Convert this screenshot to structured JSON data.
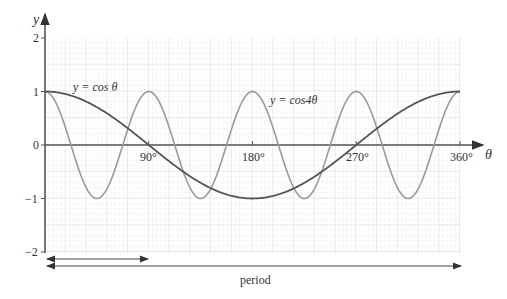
{
  "chart_data": {
    "type": "line",
    "title": "",
    "xlabel": "θ",
    "ylabel": "y",
    "xlim": [
      0,
      360
    ],
    "ylim": [
      -2,
      2
    ],
    "x_ticks": [
      "90°",
      "180°",
      "270°",
      "360°"
    ],
    "y_ticks": [
      "2",
      "1",
      "0",
      "−1",
      "−2"
    ],
    "grid": true,
    "series": [
      {
        "name": "y = cos θ",
        "color": "#555555",
        "x": [
          0,
          30,
          60,
          90,
          120,
          150,
          180,
          210,
          240,
          270,
          300,
          330,
          360
        ],
        "values": [
          1,
          0.866,
          0.5,
          0,
          -0.5,
          -0.866,
          -1,
          -0.866,
          -0.5,
          0,
          0.5,
          0.866,
          1
        ]
      },
      {
        "name": "y = cos4θ",
        "color": "#9a9a9a",
        "x": [
          0,
          22.5,
          45,
          67.5,
          90,
          112.5,
          135,
          157.5,
          180,
          202.5,
          225,
          247.5,
          270,
          292.5,
          315,
          337.5,
          360
        ],
        "values": [
          1,
          0,
          -1,
          0,
          1,
          0,
          -1,
          0,
          1,
          0,
          -1,
          0,
          1,
          0,
          -1,
          0,
          1
        ]
      }
    ],
    "annotations": [
      {
        "text": "y = cos θ",
        "near": "cos theta curve, top-left"
      },
      {
        "text": "y = cos4θ",
        "near": "cos 4theta curve, center"
      },
      {
        "text": "period",
        "type": "double arrows below axis: short arrow 0–90° (period of cos4θ), long arrow 0–360° (period of cosθ)"
      }
    ]
  },
  "labels": {
    "y_axis": "y",
    "x_axis": "θ",
    "y2": "2",
    "y1": "1",
    "y0": "0",
    "ym1": "−1",
    "ym2": "−2",
    "x90": "90°",
    "x180": "180°",
    "x270": "270°",
    "x360": "360°",
    "cos_label": "y = cos θ",
    "cos4_label": "y = cos4θ",
    "period": "period"
  }
}
